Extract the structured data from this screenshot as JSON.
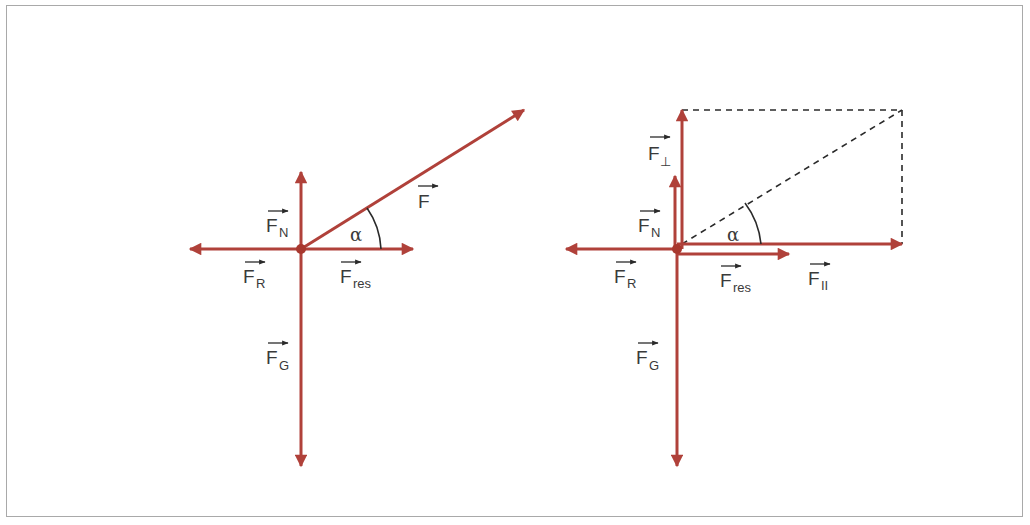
{
  "figure": {
    "colors": {
      "force": "#b0413a",
      "label": "#3a3a3a",
      "dashed": "#2a2a2a",
      "frame": "#a9a9a9"
    },
    "left_diagram": {
      "origin": [
        301,
        249
      ],
      "forces": [
        {
          "id": "F_N",
          "to": [
            301,
            172
          ]
        },
        {
          "id": "F_G",
          "to": [
            301,
            466
          ]
        },
        {
          "id": "F_R",
          "to": [
            190,
            249
          ]
        },
        {
          "id": "F_res",
          "to": [
            413,
            249
          ]
        },
        {
          "id": "F",
          "to": [
            524,
            110
          ]
        }
      ],
      "labels": {
        "F_N": {
          "main": "F",
          "sub": "N",
          "x": 266,
          "y": 232
        },
        "F_R": {
          "main": "F",
          "sub": "R",
          "x": 243,
          "y": 283
        },
        "F_res": {
          "main": "F",
          "sub": "res",
          "x": 340,
          "y": 283
        },
        "F_G": {
          "main": "F",
          "sub": "G",
          "x": 266,
          "y": 370
        },
        "F": {
          "main": "F",
          "sub": "",
          "x": 418,
          "y": 208
        },
        "alpha": {
          "text": "α",
          "x": 350,
          "y": 241
        }
      }
    },
    "right_diagram": {
      "origin": [
        677,
        249
      ],
      "forces": [
        {
          "id": "F_perp",
          "to": [
            682,
            110
          ]
        },
        {
          "id": "F_N",
          "to": [
            675,
            176
          ]
        },
        {
          "id": "F_G",
          "to": [
            677,
            466
          ]
        },
        {
          "id": "F_R",
          "to": [
            566,
            249
          ]
        },
        {
          "id": "F_res",
          "to": [
            789,
            254
          ]
        },
        {
          "id": "F_parallel",
          "to": [
            902,
            244
          ]
        }
      ],
      "labels": {
        "F_perp": {
          "main": "F",
          "sub": "⊥",
          "x": 648,
          "y": 162
        },
        "F_N": {
          "main": "F",
          "sub": "N",
          "x": 638,
          "y": 232
        },
        "F_R": {
          "main": "F",
          "sub": "R",
          "x": 614,
          "y": 283
        },
        "F_res": {
          "main": "F",
          "sub": "res",
          "x": 720,
          "y": 287
        },
        "F_parallel": {
          "main": "F",
          "sub": "II",
          "x": 808,
          "y": 285
        },
        "F_G": {
          "main": "F",
          "sub": "G",
          "x": 636,
          "y": 368
        },
        "alpha": {
          "text": "α",
          "x": 727,
          "y": 241
        }
      },
      "dashed_rect": {
        "x1": 682,
        "y1": 110,
        "x2": 902,
        "y2": 244
      }
    }
  }
}
